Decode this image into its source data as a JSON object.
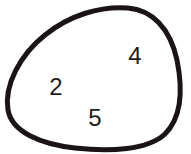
{
  "diagram": {
    "type": "set",
    "outline_color": "#1a1414",
    "elements": [
      {
        "label": "4",
        "x": 135,
        "y": 64
      },
      {
        "label": "2",
        "x": 56,
        "y": 95
      },
      {
        "label": "5",
        "x": 95,
        "y": 126
      }
    ]
  }
}
